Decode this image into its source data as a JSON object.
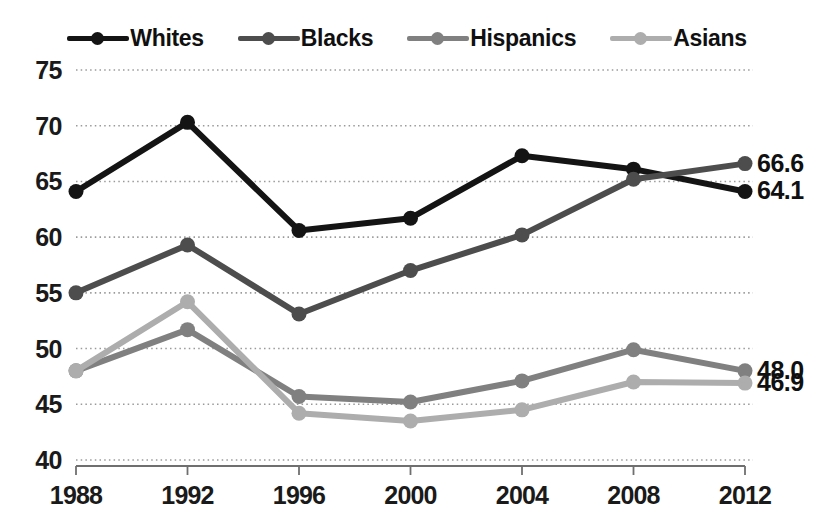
{
  "chart_data": {
    "type": "line",
    "title": "",
    "subtitle": "",
    "xlabel": "",
    "ylabel": "",
    "categories": [
      "1988",
      "1992",
      "1996",
      "2000",
      "2004",
      "2008",
      "2012"
    ],
    "x": [
      1988,
      1992,
      1996,
      2000,
      2004,
      2008,
      2012
    ],
    "ylim": [
      40,
      75
    ],
    "yticks": [
      40,
      45,
      50,
      55,
      60,
      65,
      70,
      75
    ],
    "ytick_labels": [
      "40",
      "45",
      "50",
      "55",
      "60",
      "65",
      "70",
      "75"
    ],
    "grid": true,
    "grid_style": "dotted-horizontal",
    "legend_position": "top-center",
    "series": [
      {
        "name": "Whites",
        "color": "#141414",
        "values": [
          64.1,
          70.3,
          60.6,
          61.7,
          67.3,
          66.1,
          64.1
        ],
        "end_label": "64.1"
      },
      {
        "name": "Blacks",
        "color": "#4d4d4d",
        "values": [
          55.0,
          59.3,
          53.1,
          57.0,
          60.2,
          65.2,
          66.6
        ],
        "end_label": "66.6"
      },
      {
        "name": "Hispanics",
        "color": "#808080",
        "values": [
          48.0,
          51.7,
          45.7,
          45.2,
          47.1,
          49.9,
          48.0
        ],
        "end_label": "48.0"
      },
      {
        "name": "Asians",
        "color": "#adadad",
        "values": [
          48.0,
          54.2,
          44.2,
          43.5,
          44.5,
          47.0,
          46.9
        ],
        "end_label": "46.9"
      }
    ],
    "end_labels": [
      {
        "text": "66.6",
        "series": "Blacks"
      },
      {
        "text": "64.1",
        "series": "Whites"
      },
      {
        "text": "48.0",
        "series": "Hispanics"
      },
      {
        "text": "46.9",
        "series": "Asians"
      }
    ],
    "axis_color": "#6f6f6f",
    "grid_color": "#9a9a9a",
    "background": "#ffffff"
  }
}
